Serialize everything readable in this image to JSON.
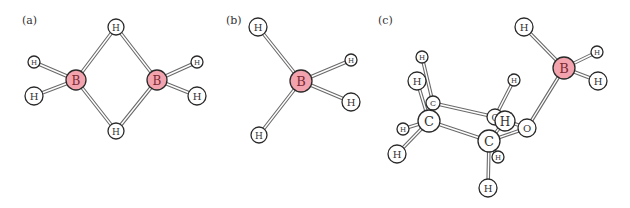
{
  "colors": {
    "boron_fill": "#f3a3ae",
    "atom_fill": "#ffffff",
    "atom_stroke": "#2a2a2a",
    "bond_color": "#6a6a6a"
  },
  "panels": [
    {
      "label": "(a)",
      "label_pos": [
        22,
        24
      ],
      "atoms": [
        {
          "id": "a-H1",
          "el": "H",
          "x": 116,
          "y": 27,
          "r": 8
        },
        {
          "id": "a-B1",
          "el": "B",
          "x": 76,
          "y": 80,
          "r": 10
        },
        {
          "id": "a-B2",
          "el": "B",
          "x": 157,
          "y": 80,
          "r": 10
        },
        {
          "id": "a-H2",
          "el": "H",
          "x": 116,
          "y": 131,
          "r": 8
        },
        {
          "id": "a-H3",
          "el": "H",
          "x": 34,
          "y": 62,
          "r": 6
        },
        {
          "id": "a-H4",
          "el": "H",
          "x": 34,
          "y": 96,
          "r": 9
        },
        {
          "id": "a-H5",
          "el": "H",
          "x": 197,
          "y": 62,
          "r": 6
        },
        {
          "id": "a-H6",
          "el": "H",
          "x": 197,
          "y": 96,
          "r": 9
        }
      ],
      "bonds": [
        [
          "a-B1",
          "a-H1"
        ],
        [
          "a-B2",
          "a-H1"
        ],
        [
          "a-B1",
          "a-H2"
        ],
        [
          "a-B2",
          "a-H2"
        ],
        [
          "a-B1",
          "a-H3"
        ],
        [
          "a-B1",
          "a-H4"
        ],
        [
          "a-B2",
          "a-H5"
        ],
        [
          "a-B2",
          "a-H6"
        ]
      ]
    },
    {
      "label": "(b)",
      "label_pos": [
        226,
        24
      ],
      "atoms": [
        {
          "id": "b-H1",
          "el": "H",
          "x": 258,
          "y": 27,
          "r": 9
        },
        {
          "id": "b-B1",
          "el": "B",
          "x": 301,
          "y": 81,
          "r": 11
        },
        {
          "id": "b-H2",
          "el": "H",
          "x": 351,
          "y": 60,
          "r": 6
        },
        {
          "id": "b-H3",
          "el": "H",
          "x": 351,
          "y": 102,
          "r": 9
        },
        {
          "id": "b-H4",
          "el": "H",
          "x": 259,
          "y": 135,
          "r": 8
        }
      ],
      "bonds": [
        [
          "b-B1",
          "b-H1"
        ],
        [
          "b-B1",
          "b-H2"
        ],
        [
          "b-B1",
          "b-H3"
        ],
        [
          "b-B1",
          "b-H4"
        ]
      ]
    },
    {
      "label": "(c)",
      "label_pos": [
        378,
        24
      ],
      "atoms": [
        {
          "id": "c-H1",
          "el": "H",
          "x": 524,
          "y": 27,
          "r": 9
        },
        {
          "id": "c-B1",
          "el": "B",
          "x": 564,
          "y": 68,
          "r": 11
        },
        {
          "id": "c-H2",
          "el": "H",
          "x": 597,
          "y": 52,
          "r": 6
        },
        {
          "id": "c-H3",
          "el": "H",
          "x": 598,
          "y": 81,
          "r": 9
        },
        {
          "id": "c-H4",
          "el": "H",
          "x": 422,
          "y": 57,
          "r": 6
        },
        {
          "id": "c-H5",
          "el": "H",
          "x": 417,
          "y": 81,
          "r": 9
        },
        {
          "id": "c-H9",
          "el": "H",
          "x": 514,
          "y": 80,
          "r": 6
        },
        {
          "id": "c-C1",
          "el": "C",
          "x": 433,
          "y": 103,
          "r": 7
        },
        {
          "id": "c-C3",
          "el": "C",
          "x": 495,
          "y": 117,
          "r": 8
        },
        {
          "id": "c-H6",
          "el": "H",
          "x": 403,
          "y": 129,
          "r": 6
        },
        {
          "id": "c-H7",
          "el": "H",
          "x": 397,
          "y": 154,
          "r": 9
        },
        {
          "id": "c-C2",
          "el": "C",
          "x": 429,
          "y": 121,
          "r": 11
        },
        {
          "id": "c-O1",
          "el": "O",
          "x": 527,
          "y": 128,
          "r": 9
        },
        {
          "id": "c-H8",
          "el": "H",
          "x": 498,
          "y": 157,
          "r": 6
        },
        {
          "id": "c-C4",
          "el": "C",
          "x": 489,
          "y": 141,
          "r": 11
        },
        {
          "id": "c-H10",
          "el": "H",
          "x": 505,
          "y": 121,
          "r": 10
        },
        {
          "id": "c-H11",
          "el": "H",
          "x": 488,
          "y": 188,
          "r": 9
        }
      ],
      "bonds": [
        [
          "c-B1",
          "c-H1"
        ],
        [
          "c-B1",
          "c-H2"
        ],
        [
          "c-B1",
          "c-H3"
        ],
        [
          "c-B1",
          "c-O1"
        ],
        [
          "c-C1",
          "c-H4"
        ],
        [
          "c-C2",
          "c-H5"
        ],
        [
          "c-C1",
          "c-C2"
        ],
        [
          "c-C1",
          "c-C3"
        ],
        [
          "c-C2",
          "c-H6"
        ],
        [
          "c-C2",
          "c-H7"
        ],
        [
          "c-C2",
          "c-C4"
        ],
        [
          "c-C3",
          "c-H9"
        ],
        [
          "c-C3",
          "c-O1"
        ],
        [
          "c-C4",
          "c-O1"
        ],
        [
          "c-C4",
          "c-H8"
        ],
        [
          "c-C4",
          "c-H11"
        ],
        [
          "c-C4",
          "c-H10"
        ]
      ]
    }
  ]
}
